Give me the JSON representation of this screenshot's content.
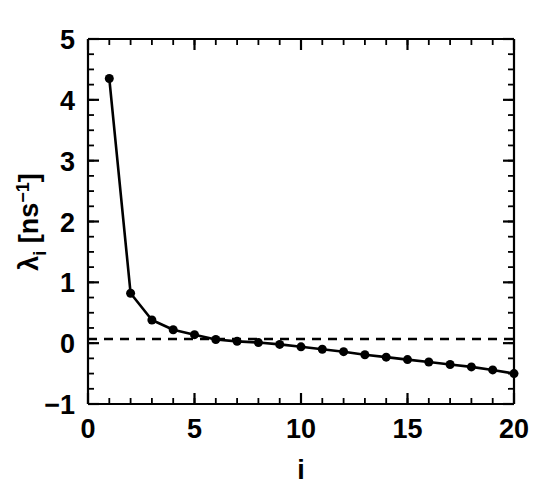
{
  "chart_data": {
    "type": "line",
    "title": "",
    "subtitle": "",
    "xlabel": "i",
    "ylabel_parts": {
      "symbol": "λ",
      "subscript": "i",
      "unit_open": " [ns",
      "unit_exponent": "−1",
      "unit_close": "]"
    },
    "ylabel": "λᵢ [ns⁻¹]",
    "xlim": [
      0,
      20
    ],
    "ylim": [
      -1,
      5
    ],
    "x_major_ticks": [
      0,
      5,
      10,
      15,
      20
    ],
    "x_major_tick_labels": [
      "0",
      "5",
      "10",
      "15",
      "20"
    ],
    "x_minor_tick_step": 1,
    "y_major_ticks": [
      -1,
      0,
      1,
      2,
      3,
      4,
      5
    ],
    "y_major_tick_labels": [
      "-1",
      "0",
      "1",
      "2",
      "3",
      "4",
      "5"
    ],
    "y_minor_tick_step": 0.25,
    "grid": false,
    "legend": null,
    "annotations": [
      {
        "name": "zero-reference-line",
        "type": "horizontal-dashed-line",
        "y": 0,
        "style": "dashed",
        "color": "#000000"
      }
    ],
    "marker": {
      "shape": "circle",
      "filled": true,
      "color": "#000000",
      "size_px": 9
    },
    "line": {
      "color": "#000000",
      "width_px": 2.5,
      "style": "solid"
    },
    "x": [
      1,
      2,
      3,
      4,
      5,
      6,
      7,
      8,
      9,
      10,
      11,
      12,
      13,
      14,
      15,
      16,
      17,
      18,
      19,
      20
    ],
    "values": [
      4.35,
      0.82,
      0.38,
      0.22,
      0.14,
      0.06,
      0.03,
      0.01,
      -0.02,
      -0.06,
      -0.1,
      -0.14,
      -0.19,
      -0.23,
      -0.27,
      -0.31,
      -0.35,
      -0.39,
      -0.44,
      -0.5
    ],
    "series": [
      {
        "name": "lambda_i",
        "values": [
          4.35,
          0.82,
          0.38,
          0.22,
          0.14,
          0.06,
          0.03,
          0.01,
          -0.02,
          -0.06,
          -0.1,
          -0.14,
          -0.19,
          -0.23,
          -0.27,
          -0.31,
          -0.35,
          -0.39,
          -0.44,
          -0.5
        ]
      }
    ],
    "colors": {
      "axis": "#000000",
      "data": "#000000",
      "background": "#ffffff"
    }
  }
}
